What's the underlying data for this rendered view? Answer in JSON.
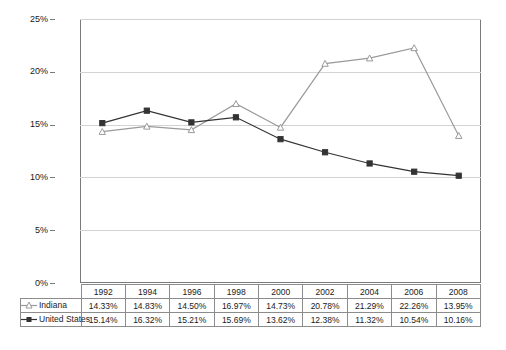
{
  "chart_data": {
    "type": "line",
    "title": "",
    "xlabel": "",
    "ylabel": "",
    "categories": [
      "1992",
      "1994",
      "1996",
      "1998",
      "2000",
      "2002",
      "2004",
      "2006",
      "2008"
    ],
    "ylim": [
      0,
      25
    ],
    "ytick_values": [
      0,
      5,
      10,
      15,
      20,
      25
    ],
    "ytick_labels": [
      "0%",
      "5%",
      "10%",
      "15%",
      "20%",
      "25%"
    ],
    "grid": true,
    "legend_position": "data-table-below",
    "series": [
      {
        "name": "Indiana",
        "marker": "triangle-open",
        "color": "#9a9a9a",
        "values": [
          14.33,
          14.83,
          14.5,
          16.97,
          14.73,
          20.78,
          21.29,
          22.26,
          13.95
        ],
        "labels": [
          "14.33%",
          "14.83%",
          "14.50%",
          "16.97%",
          "14.73%",
          "20.78%",
          "21.29%",
          "22.26%",
          "13.95%"
        ]
      },
      {
        "name": "United States",
        "marker": "square-filled",
        "color": "#333333",
        "values": [
          15.14,
          16.32,
          15.21,
          15.69,
          13.62,
          12.38,
          11.32,
          10.54,
          10.16
        ],
        "labels": [
          "15.14%",
          "16.32%",
          "15.21%",
          "15.69%",
          "13.62%",
          "12.38%",
          "11.32%",
          "10.54%",
          "10.16%"
        ]
      }
    ]
  },
  "table": {
    "header_row": [
      "",
      "1992",
      "1994",
      "1996",
      "1998",
      "2000",
      "2002",
      "2004",
      "2006",
      "2008"
    ],
    "rows": [
      {
        "label": "Indiana",
        "key_icon": "triangle-open-marker-icon",
        "cells": [
          "14.33%",
          "14.83%",
          "14.50%",
          "16.97%",
          "14.73%",
          "20.78%",
          "21.29%",
          "22.26%",
          "13.95%"
        ]
      },
      {
        "label": "United States",
        "key_icon": "square-filled-marker-icon",
        "cells": [
          "15.14%",
          "16.32%",
          "15.21%",
          "15.69%",
          "13.62%",
          "12.38%",
          "11.32%",
          "10.54%",
          "10.16%"
        ]
      }
    ]
  },
  "colors": {
    "indiana_line": "#9a9a9a",
    "united_states_line": "#333333",
    "gridline": "#d3d3d3",
    "plot_border": "#7a7a7a",
    "table_border": "#8c8c8c",
    "background": "#ffffff"
  }
}
